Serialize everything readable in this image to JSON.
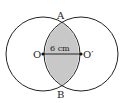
{
  "labels": {
    "A": "A",
    "B": "B",
    "O": "O",
    "O2": "O′",
    "distance": "6 cm"
  },
  "colors": {
    "stroke": "#222222",
    "shade": "#c8c8c8"
  }
}
